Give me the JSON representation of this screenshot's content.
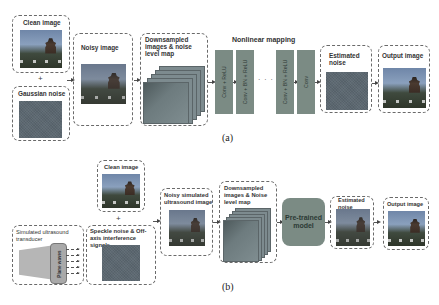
{
  "panel_a": {
    "caption": "(a)",
    "clean_image": "Clean image",
    "plus": "+",
    "gaussian_noise": "Gaussian noise",
    "noisy_image": "Noisy image",
    "downsampled": "Downsampled images & noise level map",
    "nonlinear_title": "Nonlinear mapping",
    "layers": [
      "Conv + ReLU",
      "Conv + BN + ReLU",
      "Conv + BN + ReLU",
      "Conv"
    ],
    "dots": "· · · ·",
    "estimated_noise": "Estimated noise",
    "output_image": "Output image"
  },
  "panel_b": {
    "caption": "(b)",
    "clean_image": "Clean image",
    "plus": "+",
    "transducer": "Simulated ultrasound transducer",
    "plane_waves": "Plane waves",
    "speckle": "Speckle noise & Off-axis interference signals",
    "noisy_us": "Noisy simulated ultrasound image",
    "downsampled": "Downsampled images & Noise level map",
    "pretrained": "Pre-trained model",
    "estimated_noise": "Estimated noise",
    "output_image": "Output image"
  },
  "colors": {
    "block_fill": "#7b8b84",
    "dashed_border": "#6a6a6a",
    "noise_fill": "#5b6770"
  }
}
